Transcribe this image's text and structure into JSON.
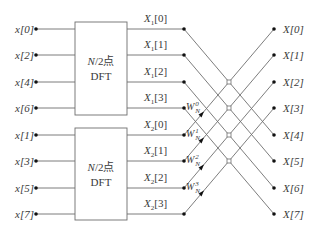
{
  "diagram": {
    "type": "8-point radix-2 decimation-in-time FFT butterfly (first stage after two N/2 DFTs)",
    "colors": {
      "line": "#6e6e6e",
      "dot": "#111111",
      "text": "#3a3a3a",
      "background": "#ffffff"
    },
    "inputs_top": [
      "x[0]",
      "x[2]",
      "x[4]",
      "x[6]"
    ],
    "inputs_bottom": [
      "x[1]",
      "x[3]",
      "x[5]",
      "x[7]"
    ],
    "blocks": [
      {
        "line1_italic": "N",
        "line1_rest": "/2点",
        "line2": "DFT"
      },
      {
        "line1_italic": "N",
        "line1_rest": "/2点",
        "line2": "DFT"
      }
    ],
    "intermediate_top": [
      {
        "base": "X",
        "sub": "1",
        "idx": "[0]"
      },
      {
        "base": "X",
        "sub": "1",
        "idx": "[1]"
      },
      {
        "base": "X",
        "sub": "1",
        "idx": "[2]"
      },
      {
        "base": "X",
        "sub": "1",
        "idx": "[3]"
      }
    ],
    "intermediate_bottom": [
      {
        "base": "X",
        "sub": "2",
        "idx": "[0]"
      },
      {
        "base": "X",
        "sub": "2",
        "idx": "[1]"
      },
      {
        "base": "X",
        "sub": "2",
        "idx": "[2]"
      },
      {
        "base": "X",
        "sub": "2",
        "idx": "[3]"
      }
    ],
    "twiddles": [
      {
        "base": "W",
        "sup": "0",
        "sub": "N"
      },
      {
        "base": "W",
        "sup": "1",
        "sub": "N"
      },
      {
        "base": "W",
        "sup": "2",
        "sub": "N"
      },
      {
        "base": "W",
        "sup": "3",
        "sub": "N"
      }
    ],
    "outputs": [
      "X[0]",
      "X[1]",
      "X[2]",
      "X[3]",
      "X[4]",
      "X[5]",
      "X[6]",
      "X[7]"
    ]
  }
}
